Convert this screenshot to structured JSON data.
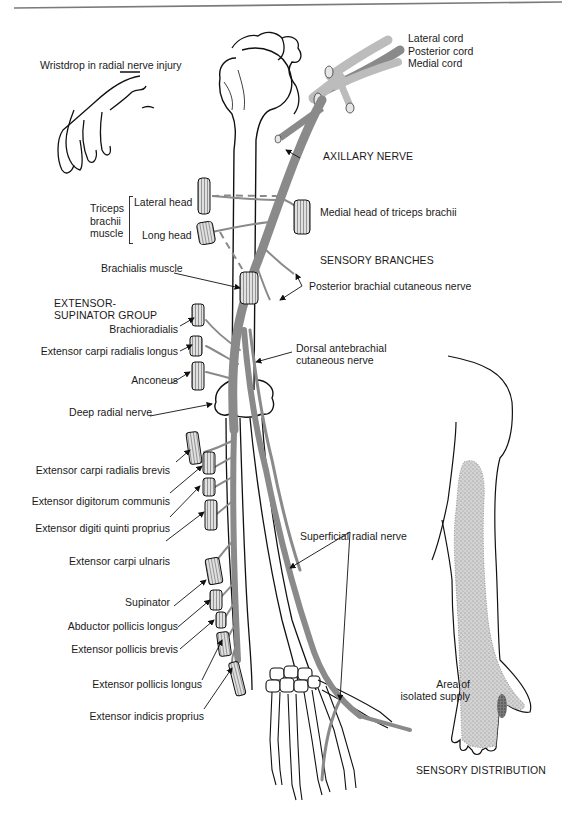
{
  "figure": {
    "topic": "Radial nerve distribution",
    "colors": {
      "nerve": "#8a8a8a",
      "bone_outline": "#111111",
      "muscle_fill": "#bdbdbd",
      "stipple": "#a9a9a9",
      "isolated_supply": "#555555",
      "rule": "#7a7a7a"
    }
  },
  "inset_wristdrop": {
    "title": "Wristdrop in radial nerve injury"
  },
  "brachial_plexus": {
    "cords": [
      "Lateral cord",
      "Posterior cord",
      "Medial cord"
    ]
  },
  "upper_arm": {
    "axillary_nerve": "AXILLARY NERVE",
    "triceps_group": {
      "label_lines": [
        "Triceps",
        "brachii",
        "muscle"
      ],
      "heads": [
        "Lateral head",
        "Long head"
      ]
    },
    "medial_head": "Medial head of triceps brachii",
    "brachialis": "Brachialis muscle",
    "sensory_branches": {
      "heading": "SENSORY BRANCHES",
      "posterior_brachial": "Posterior brachial cutaneous nerve",
      "dorsal_antebrachial_lines": [
        "Dorsal antebrachial",
        "cutaneous nerve"
      ]
    }
  },
  "extensor_supinator_group": {
    "heading_lines": [
      "EXTENSOR-",
      "SUPINATOR GROUP"
    ],
    "muscles": [
      "Brachioradialis",
      "Extensor carpi radialis longus",
      "Anconeus",
      "Deep radial nerve",
      "Extensor carpi radialis brevis",
      "Extensor digitorum communis",
      "Extensor digiti quinti proprius",
      "Extensor carpi ulnaris",
      "Supinator",
      "Abductor pollicis longus",
      "Extensor pollicis brevis",
      "Extensor pollicis longus",
      "Extensor indicis proprius"
    ]
  },
  "forearm": {
    "superficial_radial": "Superficial radial nerve"
  },
  "sensory_distribution": {
    "isolated_lines": [
      "Area of",
      "isolated supply"
    ],
    "caption": "SENSORY DISTRIBUTION"
  }
}
